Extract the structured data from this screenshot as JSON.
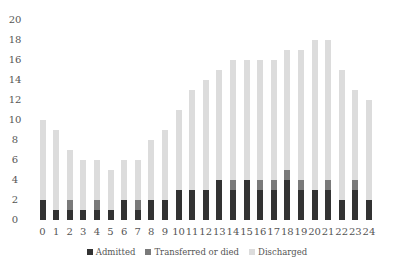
{
  "chart_data": {
    "type": "bar",
    "stacked": true,
    "title": "",
    "xlabel": "",
    "ylabel": "",
    "ylim": [
      0,
      20
    ],
    "yticks": [
      0,
      2,
      4,
      6,
      8,
      10,
      12,
      14,
      16,
      18,
      20
    ],
    "grid": false,
    "legend_position": "bottom",
    "categories": [
      "0",
      "1",
      "2",
      "3",
      "4",
      "5",
      "6",
      "7",
      "8",
      "9",
      "10",
      "11",
      "12",
      "13",
      "14",
      "15",
      "16",
      "17",
      "18",
      "19",
      "20",
      "21",
      "22",
      "23",
      "24"
    ],
    "series": [
      {
        "name": "Admitted",
        "color": "#333333",
        "values": [
          2,
          1,
          1,
          1,
          1,
          1,
          2,
          1,
          2,
          2,
          3,
          3,
          3,
          4,
          3,
          4,
          3,
          3,
          4,
          3,
          3,
          3,
          2,
          3,
          2
        ]
      },
      {
        "name": "Transferred or died",
        "color": "#7a7a7a",
        "values": [
          0,
          0,
          1,
          0,
          1,
          0,
          0,
          1,
          0,
          0,
          0,
          0,
          0,
          0,
          1,
          0,
          1,
          1,
          1,
          1,
          0,
          1,
          0,
          1,
          0
        ]
      },
      {
        "name": "Discharged",
        "color": "#dcdcdc",
        "values": [
          8,
          8,
          5,
          5,
          4,
          4,
          4,
          4,
          6,
          7,
          8,
          10,
          11,
          11,
          12,
          12,
          12,
          12,
          12,
          13,
          15,
          14,
          13,
          9,
          10
        ]
      }
    ],
    "totals": [
      10,
      9,
      7,
      6,
      6,
      5,
      6,
      6,
      8,
      9,
      11,
      13,
      14,
      15,
      16,
      16,
      16,
      16,
      17,
      17,
      18,
      18,
      15,
      13,
      12
    ]
  }
}
